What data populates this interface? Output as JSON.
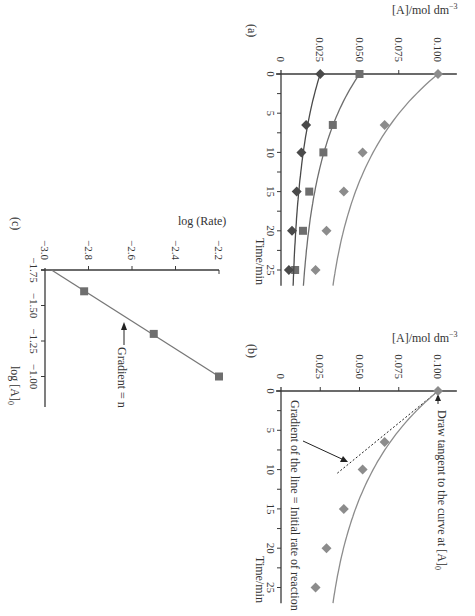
{
  "colors": {
    "axis": "#3a3a3a",
    "text": "#333333",
    "series_light": "#8c8c8c",
    "series_mid": "#6e6e6e",
    "series_dark": "#4a4a4a",
    "background": "#ffffff"
  },
  "chart_data": [
    {
      "panel": "(a)",
      "type": "line",
      "title": "",
      "xlabel": "Time/min",
      "ylabel": "[A]/mol dm⁻³",
      "xlim": [
        0,
        27
      ],
      "ylim": [
        0,
        0.11
      ],
      "xticks": [
        0,
        5,
        10,
        15,
        20,
        25
      ],
      "xticklabels": [
        "0",
        "5",
        "10",
        "15",
        "20",
        "25"
      ],
      "yticks": [
        0,
        0.025,
        0.05,
        0.075,
        0.1
      ],
      "yticklabels": [
        "0",
        "0.025",
        "0.050",
        "0.075",
        "0.100"
      ],
      "grid": false,
      "series": [
        {
          "name": "[A]0 = 0.100",
          "marker": "diamond",
          "color": "#8c8c8c",
          "x": [
            0,
            6.5,
            10,
            15,
            20,
            25
          ],
          "values": [
            0.1,
            0.066,
            0.052,
            0.04,
            0.029,
            0.022
          ]
        },
        {
          "name": "[A]0 = 0.050",
          "marker": "square",
          "color": "#6e6e6e",
          "x": [
            0,
            6.5,
            10,
            15,
            20,
            25
          ],
          "values": [
            0.05,
            0.033,
            0.027,
            0.018,
            0.014,
            0.009
          ]
        },
        {
          "name": "[A]0 = 0.025",
          "marker": "diamond",
          "color": "#4a4a4a",
          "x": [
            0,
            6.5,
            10,
            15,
            20,
            25
          ],
          "values": [
            0.025,
            0.016,
            0.013,
            0.01,
            0.007,
            0.005
          ]
        }
      ]
    },
    {
      "panel": "(b)",
      "type": "line",
      "title": "",
      "xlabel": "Time/min",
      "ylabel": "[A]/mol dm⁻³",
      "xlim": [
        0,
        27
      ],
      "ylim": [
        0,
        0.11
      ],
      "xticks": [
        0,
        5,
        10,
        15,
        20,
        25
      ],
      "xticklabels": [
        "0",
        "5",
        "10",
        "15",
        "20",
        "25"
      ],
      "yticks": [
        0,
        0.025,
        0.05,
        0.075,
        0.1
      ],
      "yticklabels": [
        "0",
        "0.025",
        "0.050",
        "0.075",
        "0.100"
      ],
      "grid": false,
      "series": [
        {
          "name": "[A]0 = 0.100",
          "marker": "diamond",
          "color": "#8c8c8c",
          "x": [
            0,
            6.5,
            10,
            15,
            20,
            25
          ],
          "values": [
            0.1,
            0.066,
            0.052,
            0.04,
            0.029,
            0.022
          ]
        }
      ],
      "tangent": {
        "x": [
          0,
          10.6
        ],
        "values": [
          0.1,
          0.035
        ],
        "style": "dashed"
      },
      "annotations": [
        {
          "text": "Draw tangent to the curve at [A]₀",
          "points_to": "t=0, [A]=0.100"
        },
        {
          "text": "Gradient of the line = Initial rate of reaction",
          "points_to": "tangent line"
        }
      ]
    },
    {
      "panel": "(c)",
      "type": "scatter",
      "title": "",
      "xlabel": "log [A]₀",
      "ylabel": "log (Rate)",
      "xlim": [
        -1.75,
        -0.85
      ],
      "ylim": [
        -3.0,
        -2.2
      ],
      "xticks": [
        -1.75,
        -1.5,
        -1.25,
        -1.0
      ],
      "xticklabels": [
        "−1.75",
        "−1.50",
        "−1.25",
        "−1.00"
      ],
      "yticks": [
        -3.0,
        -2.8,
        -2.6,
        -2.4,
        -2.2
      ],
      "yticklabels": [
        "−3.0",
        "−2.8",
        "−2.6",
        "−2.4",
        "−2.2"
      ],
      "grid": false,
      "series": [
        {
          "name": "log rate vs log [A]0",
          "marker": "square",
          "color": "#6e6e6e",
          "x": [
            -1.6,
            -1.3,
            -1.0
          ],
          "values": [
            -2.82,
            -2.5,
            -2.2
          ]
        }
      ],
      "fit_line": {
        "x": [
          -1.75,
          -1.0
        ],
        "values": [
          -2.97,
          -2.2
        ]
      },
      "annotations": [
        {
          "text": "Gradient = n",
          "points_to": "fit line"
        }
      ]
    }
  ],
  "labels": {
    "panel_a": "(a)",
    "panel_b": "(b)",
    "panel_c": "(c)",
    "conc_axis": "[A]/mol dm",
    "conc_exp": "−3",
    "time_axis": "Time/min",
    "log_rate_axis": "log (Rate)",
    "log_conc_axis": "log [A]",
    "log_conc_sub": "0",
    "tangent_note": "Draw tangent to the curve at [A]",
    "tangent_sub": "0",
    "gradient_note": "Gradient of the line = Initial rate of reaction",
    "gradient_n": "Gradient = n"
  }
}
